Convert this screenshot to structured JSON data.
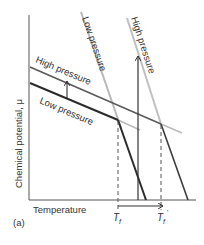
{
  "figure": {
    "panel_label": "(a)",
    "x_axis_label": "Temperature",
    "y_axis_label": "Chemical potential, μ",
    "tick_labels": {
      "tf": "T",
      "tf_sub": "f",
      "tf_prime": "T",
      "tf_prime_sub": "f",
      "tf_prime_mark": "'"
    },
    "line_labels": {
      "steep_low": "Low pressure",
      "steep_high": "High pressure",
      "shallow_high": "High pressure",
      "shallow_low": "Low pressure"
    },
    "colors": {
      "dark_line": "#2b2b2b",
      "mid_line": "#6e6e6e",
      "light_line": "#b8b8b8",
      "axis": "#444444",
      "text": "#333333"
    }
  }
}
